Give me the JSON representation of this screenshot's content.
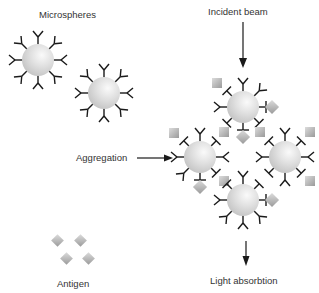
{
  "labels": {
    "microspheres": "Microspheres",
    "incident_beam": "Incident beam",
    "aggregation": "Aggregation",
    "antigen": "Antigen",
    "light_absorption": "Light absorbtion"
  },
  "colors": {
    "sphere_light": "#f4f4f4",
    "sphere_dark": "#c8c8c8",
    "antigen_light": "#d8d8d8",
    "antigen_dark": "#9a9a9a",
    "line": "#1a1a1a",
    "text": "#333333"
  },
  "free_microspheres": [
    {
      "cx": 38,
      "cy": 60
    },
    {
      "cx": 104,
      "cy": 93
    }
  ],
  "cluster_microspheres": [
    {
      "cx": 243,
      "cy": 107
    },
    {
      "cx": 200,
      "cy": 157
    },
    {
      "cx": 285,
      "cy": 157
    },
    {
      "cx": 243,
      "cy": 200
    }
  ]
}
